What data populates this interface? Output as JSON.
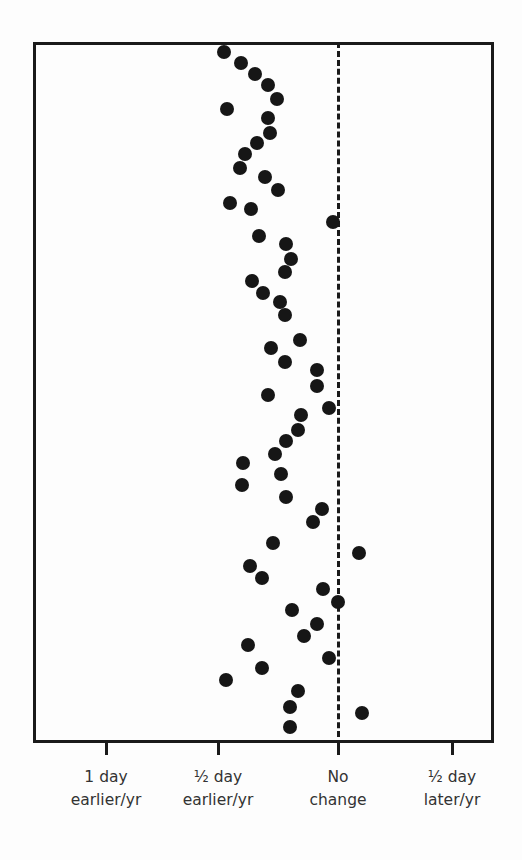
{
  "chart_data": {
    "type": "scatter",
    "title": "",
    "xlabel": "Change in timing (days per year)",
    "ylabel": "",
    "x_ticks": [
      {
        "value": -1.0,
        "label_line1": "1 day",
        "label_line2": "earlier/yr",
        "px": 106
      },
      {
        "value": -0.5,
        "label_line1": "½ day",
        "label_line2": "earlier/yr",
        "px": 218
      },
      {
        "value": 0.0,
        "label_line1": "No",
        "label_line2": "change",
        "px": 338
      },
      {
        "value": 0.5,
        "label_line1": "½ day",
        "label_line2": "later/yr",
        "px": 452
      }
    ],
    "reference_line": {
      "x": 0,
      "style": "dashed",
      "label": "No change"
    },
    "xlim": [
      -1.2,
      0.65
    ],
    "grid": false,
    "legend": null,
    "points": [
      {
        "px": 224,
        "py": 52,
        "x": -0.48
      },
      {
        "px": 241,
        "py": 63,
        "x": -0.4
      },
      {
        "px": 255,
        "py": 74,
        "x": -0.35
      },
      {
        "px": 268,
        "py": 85,
        "x": -0.29
      },
      {
        "px": 277,
        "py": 99,
        "x": -0.25
      },
      {
        "px": 227,
        "py": 109,
        "x": -0.46
      },
      {
        "px": 268,
        "py": 118,
        "x": -0.29
      },
      {
        "px": 270,
        "py": 133,
        "x": -0.28
      },
      {
        "px": 257,
        "py": 143,
        "x": -0.34
      },
      {
        "px": 245,
        "py": 154,
        "x": -0.39
      },
      {
        "px": 240,
        "py": 168,
        "x": -0.41
      },
      {
        "px": 265,
        "py": 177,
        "x": -0.3
      },
      {
        "px": 278,
        "py": 190,
        "x": -0.25
      },
      {
        "px": 230,
        "py": 203,
        "x": -0.45
      },
      {
        "px": 251,
        "py": 209,
        "x": -0.36
      },
      {
        "px": 333,
        "py": 222,
        "x": -0.02
      },
      {
        "px": 259,
        "py": 236,
        "x": -0.33
      },
      {
        "px": 286,
        "py": 244,
        "x": -0.22
      },
      {
        "px": 291,
        "py": 259,
        "x": -0.2
      },
      {
        "px": 285,
        "py": 272,
        "x": -0.22
      },
      {
        "px": 252,
        "py": 281,
        "x": -0.36
      },
      {
        "px": 263,
        "py": 293,
        "x": -0.31
      },
      {
        "px": 280,
        "py": 302,
        "x": -0.24
      },
      {
        "px": 285,
        "py": 315,
        "x": -0.22
      },
      {
        "px": 300,
        "py": 340,
        "x": -0.16
      },
      {
        "px": 271,
        "py": 348,
        "x": -0.28
      },
      {
        "px": 285,
        "py": 362,
        "x": -0.22
      },
      {
        "px": 317,
        "py": 370,
        "x": -0.09
      },
      {
        "px": 317,
        "py": 386,
        "x": -0.09
      },
      {
        "px": 268,
        "py": 395,
        "x": -0.29
      },
      {
        "px": 329,
        "py": 408,
        "x": -0.04
      },
      {
        "px": 301,
        "py": 415,
        "x": -0.15
      },
      {
        "px": 298,
        "py": 430,
        "x": -0.17
      },
      {
        "px": 286,
        "py": 441,
        "x": -0.22
      },
      {
        "px": 275,
        "py": 454,
        "x": -0.26
      },
      {
        "px": 243,
        "py": 463,
        "x": -0.4
      },
      {
        "px": 281,
        "py": 474,
        "x": -0.24
      },
      {
        "px": 242,
        "py": 485,
        "x": -0.4
      },
      {
        "px": 286,
        "py": 497,
        "x": -0.22
      },
      {
        "px": 322,
        "py": 509,
        "x": -0.07
      },
      {
        "px": 313,
        "py": 522,
        "x": -0.1
      },
      {
        "px": 273,
        "py": 543,
        "x": -0.27
      },
      {
        "px": 359,
        "py": 553,
        "x": 0.09
      },
      {
        "px": 250,
        "py": 566,
        "x": -0.37
      },
      {
        "px": 262,
        "py": 578,
        "x": -0.32
      },
      {
        "px": 323,
        "py": 589,
        "x": -0.06
      },
      {
        "px": 338,
        "py": 602,
        "x": 0.0
      },
      {
        "px": 292,
        "py": 610,
        "x": -0.19
      },
      {
        "px": 317,
        "py": 624,
        "x": -0.09
      },
      {
        "px": 304,
        "py": 636,
        "x": -0.14
      },
      {
        "px": 248,
        "py": 645,
        "x": -0.38
      },
      {
        "px": 329,
        "py": 658,
        "x": -0.04
      },
      {
        "px": 262,
        "py": 668,
        "x": -0.32
      },
      {
        "px": 226,
        "py": 680,
        "x": -0.47
      },
      {
        "px": 298,
        "py": 691,
        "x": -0.17
      },
      {
        "px": 290,
        "py": 707,
        "x": -0.2
      },
      {
        "px": 362,
        "py": 713,
        "x": 0.1
      },
      {
        "px": 290,
        "py": 727,
        "x": -0.2
      }
    ]
  }
}
